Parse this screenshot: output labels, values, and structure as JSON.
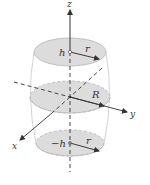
{
  "figure": {
    "axes": {
      "x_label": "x",
      "y_label": "y",
      "z_label": "z"
    },
    "sections": {
      "top": {
        "height_label": "h",
        "radius_label": "r"
      },
      "middle": {
        "radius_label": "R"
      },
      "bottom": {
        "height_label": "−h",
        "radius_label": "r"
      }
    },
    "colors": {
      "disk_fill": "#dcdcdc",
      "disk_stroke": "#b5b5b5",
      "outline": "#c8c8c8",
      "axis": "#333333",
      "arrow": "#3a3a3a"
    }
  }
}
